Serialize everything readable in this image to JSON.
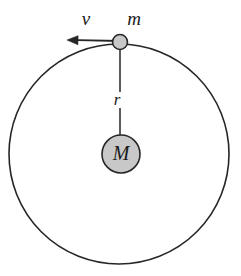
{
  "figure": {
    "kind": "physics-orbital-diagram",
    "background_color": "#ffffff",
    "stroke_color": "#262626",
    "body_fill_color": "#c8c8c8",
    "orbit": {
      "name": "orbit-circle",
      "center_x": 119,
      "center_y": 154,
      "radius": 110,
      "stroke_width": 1.6
    },
    "central_body": {
      "name": "central-mass",
      "label": "M",
      "center_x": 121,
      "center_y": 154,
      "radius": 19,
      "fill": "#c8c8c8",
      "stroke_width": 1.6,
      "label_x": 121,
      "label_y": 155
    },
    "orbiting_body": {
      "name": "orbiting-mass",
      "label": "m",
      "center_x": 120,
      "center_y": 42,
      "radius": 7.5,
      "fill": "#c8c8c8",
      "stroke_width": 1.6,
      "label_x": 134,
      "label_y": 21
    },
    "radius_line": {
      "name": "radius-line",
      "label": "r",
      "x": 120,
      "y_top": 49,
      "y_gap_start": 92,
      "y_gap_end": 108,
      "y_bottom": 154,
      "stroke_width": 1.5,
      "label_x": 117,
      "label_y": 101
    },
    "velocity_vector": {
      "name": "velocity-arrow",
      "label": "v",
      "tail_x": 120,
      "tail_y": 41,
      "tip_x": 67,
      "tip_y": 40,
      "stroke_width": 1.8,
      "head_length": 11,
      "head_half_width": 4.5,
      "label_x": 86,
      "label_y": 21
    }
  }
}
